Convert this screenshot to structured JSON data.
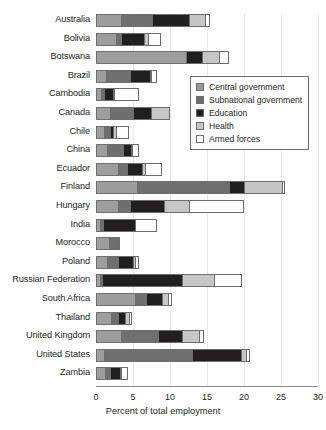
{
  "chart_data": {
    "type": "bar",
    "orientation": "horizontal",
    "stacked": true,
    "title": "",
    "xlabel": "Percent of total employment",
    "ylabel": "",
    "xlim": [
      0,
      30
    ],
    "xticks": [
      0,
      5,
      10,
      15,
      20,
      25,
      30
    ],
    "grid": true,
    "legend_position": "inside-upper-right",
    "categories": [
      "Australia",
      "Bolivia",
      "Botswana",
      "Brazil",
      "Cambodia",
      "Canada",
      "Chile",
      "China",
      "Ecuador",
      "Finland",
      "Hungary",
      "India",
      "Morocco",
      "Poland",
      "Russian Federation",
      "South Africa",
      "Thailand",
      "United Kingdom",
      "United States",
      "Zambia"
    ],
    "series": [
      {
        "name": "Central government",
        "color": "#9d9d9d",
        "values": [
          3.2,
          2.6,
          12.0,
          1.2,
          0.5,
          1.8,
          1.0,
          1.3,
          2.9,
          5.4,
          2.8,
          0.4,
          1.7,
          1.4,
          0.4,
          5.2,
          1.9,
          3.2,
          0.9,
          1.1
        ]
      },
      {
        "name": "Subnational government",
        "color": "#6f6f6f",
        "values": [
          4.3,
          0.6,
          0.0,
          3.3,
          0.4,
          3.1,
          0.7,
          2.2,
          1.2,
          12.5,
          1.6,
          0.4,
          0.9,
          1.4,
          0.3,
          1.4,
          1.0,
          5.1,
          12.0,
          0.7
        ]
      },
      {
        "name": "Education",
        "color": "#231f20",
        "values": [
          4.9,
          3.2,
          2.2,
          2.6,
          1.3,
          2.4,
          0.5,
          1.1,
          2.0,
          1.9,
          4.6,
          4.4,
          0.2,
          2.1,
          10.8,
          2.2,
          0.9,
          3.2,
          6.5,
          1.3
        ]
      },
      {
        "name": "Health",
        "color": "#c6c6c6",
        "values": [
          2.2,
          0.5,
          2.3,
          0.2,
          0.1,
          2.4,
          0.4,
          0.2,
          0.4,
          5.2,
          3.4,
          0.0,
          0.1,
          0.3,
          4.3,
          0.8,
          0.5,
          2.3,
          0.7,
          0.2
        ]
      },
      {
        "name": "Armed forces",
        "color": "#ffffff",
        "values": [
          0.5,
          1.6,
          1.2,
          0.7,
          3.3,
          0.0,
          1.6,
          0.8,
          2.2,
          0.3,
          7.3,
          2.8,
          0.1,
          0.4,
          3.7,
          0.4,
          0.3,
          0.5,
          0.4,
          0.7
        ]
      }
    ]
  },
  "legend": {
    "items": [
      {
        "label": "Central government",
        "color": "#9d9d9d"
      },
      {
        "label": "Subnational government",
        "color": "#6f6f6f"
      },
      {
        "label": "Education",
        "color": "#231f20"
      },
      {
        "label": "Health",
        "color": "#c6c6c6"
      },
      {
        "label": "Armed forces",
        "color": "#ffffff"
      }
    ]
  },
  "axis": {
    "x_title": "Percent of total employment",
    "x_tick_labels": [
      "0",
      "5",
      "10",
      "15",
      "20",
      "25",
      "30"
    ]
  }
}
